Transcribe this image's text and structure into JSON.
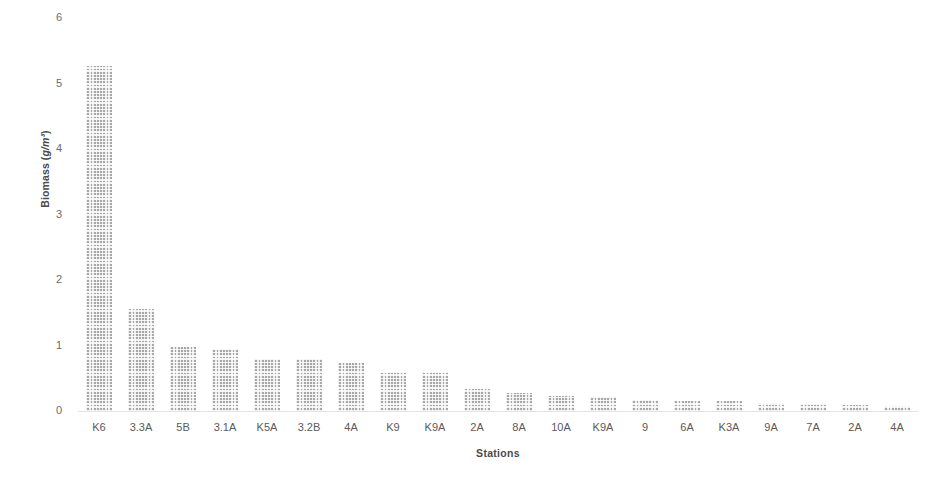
{
  "chart_data": {
    "type": "bar",
    "title": "",
    "subtitle": "",
    "xlabel": "Stations",
    "ylabel": "Biomass (g/m³)",
    "ylabel_text": "Biomass (",
    "ylabel_unit": "g/m³",
    "ylabel_text_end": ")",
    "categories": [
      "K6",
      "3.3A",
      "5B",
      "3.1A",
      "K5A",
      "3.2B",
      "4A",
      "K9",
      "K9A",
      "2A",
      "8A",
      "10A",
      "K9A",
      "9",
      "6A",
      "K3A",
      "9A",
      "7A",
      "2A",
      "4A"
    ],
    "values": [
      5.27,
      1.55,
      0.97,
      0.94,
      0.8,
      0.8,
      0.73,
      0.6,
      0.6,
      0.33,
      0.27,
      0.23,
      0.22,
      0.17,
      0.16,
      0.15,
      0.13,
      0.1,
      0.09,
      0.07
    ],
    "ylim": [
      0,
      6
    ],
    "yticks": [
      0,
      1,
      2,
      3,
      4,
      5,
      6
    ],
    "ytick_labels": [
      "0",
      "1",
      "2",
      "3",
      "4",
      "5",
      "6"
    ],
    "grid": false,
    "legend": "none",
    "bar_color": "#a7a7a7",
    "bar_pattern": "dotted-stipple",
    "axis_color": "#e4e4e4",
    "text_color": "#5a5a5a"
  }
}
